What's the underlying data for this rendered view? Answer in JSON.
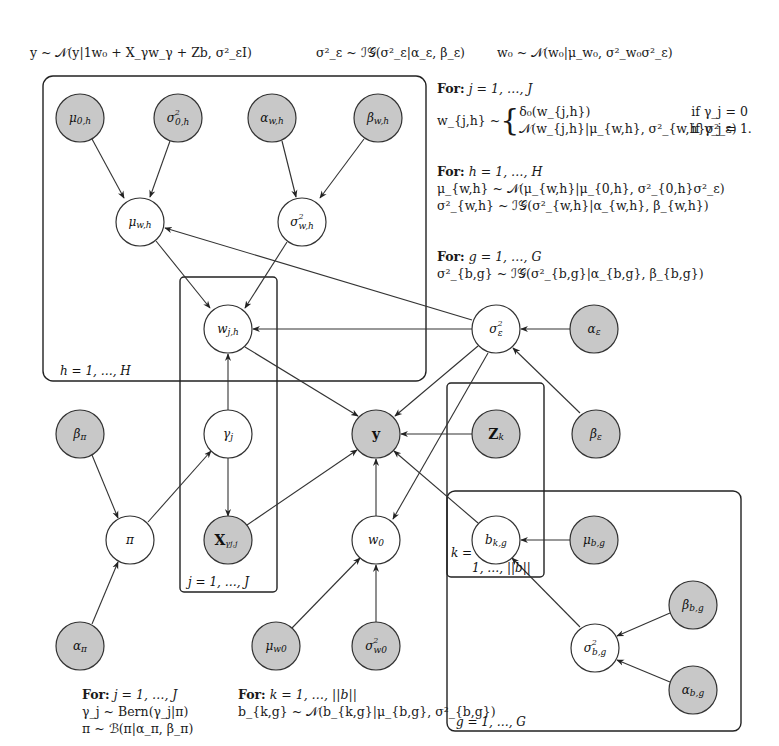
{
  "top_equations": [
    "y ~ 𝒩(y|1w₀ + X_γw_γ + Zb, σ²_εI)",
    "σ²_ε ~ ℐ𝒢(σ²_ε|α_ε, β_ε)",
    "w₀ ~ 𝒩(w₀|μ_w₀, σ²_w₀σ²_ε)"
  ],
  "right_text": {
    "block_j": {
      "header": "For:",
      "range": "j = 1, …, J",
      "lhs": "w_{j,h} ~",
      "case1_expr": "δ₀(w_{j,h})",
      "case1_cond": "if γ_j = 0",
      "case2_expr": "𝒩(w_{j,h}|μ_{w,h}, σ²_{w,h}σ²_ε)",
      "case2_cond": "if γ_j = 1."
    },
    "block_h": {
      "header": "For:",
      "range": "h = 1, …, H",
      "line1": "μ_{w,h} ~ 𝒩(μ_{w,h}|μ_{0,h}, σ²_{0,h}σ²_ε)",
      "line2": "σ²_{w,h} ~ ℐ𝒢(σ²_{w,h}|α_{w,h}, β_{w,h})"
    },
    "block_g": {
      "header": "For:",
      "range": "g = 1, …, G",
      "line1": "σ²_{b,g} ~ ℐ𝒢(σ²_{b,g}|α_{b,g}, β_{b,g})"
    }
  },
  "bottom_text": {
    "left": {
      "header": "For:",
      "range": "j = 1, …, J",
      "line1": "γ_j ~ Bern(γ_j|π)",
      "line2": "π ~ ℬ(π|α_π, β_π)"
    },
    "middle": {
      "header": "For:",
      "range": "k = 1, …, ||b||",
      "line1": "b_{k,g} ~ 𝒩(b_{k,g}|μ_{b,g}, σ²_{b,g})"
    }
  },
  "plates": {
    "h": "h = 1, …, H",
    "j": "j = 1, …, J",
    "k_line1": "k =",
    "k_line2": "1, …, ||b||",
    "g": "g = 1, …, G"
  },
  "nodes": {
    "mu0h": "μ₀,ₕ",
    "sigma2_0h": "σ²₀,ₕ",
    "alpha_wh": "α_w,h",
    "beta_wh": "β_w,h",
    "mu_wh": "μ_w,h",
    "sigma2_wh": "σ²_w,h",
    "w_jh": "w_j,h",
    "sigma2_eps": "σ²_ε",
    "alpha_eps": "α_ε",
    "beta_pi": "β_π",
    "gamma_j": "γ_j",
    "y": "y",
    "Z_k": "Z_k",
    "beta_eps": "β_ε",
    "pi": "π",
    "X_gamma_j": "X_γj,j",
    "w0": "w₀",
    "b_kg": "b_k,g",
    "mu_bg": "μ_b,g",
    "alpha_pi": "α_π",
    "mu_w0": "μ_w₀",
    "sigma2_w0": "σ²_w₀",
    "sigma2_bg": "σ²_b,g",
    "beta_bg": "β_b,g",
    "alpha_bg": "α_b,g"
  },
  "colors": {
    "observed_fill": "#c8c8c8",
    "latent_fill": "#ffffff",
    "stroke": "#333333"
  }
}
